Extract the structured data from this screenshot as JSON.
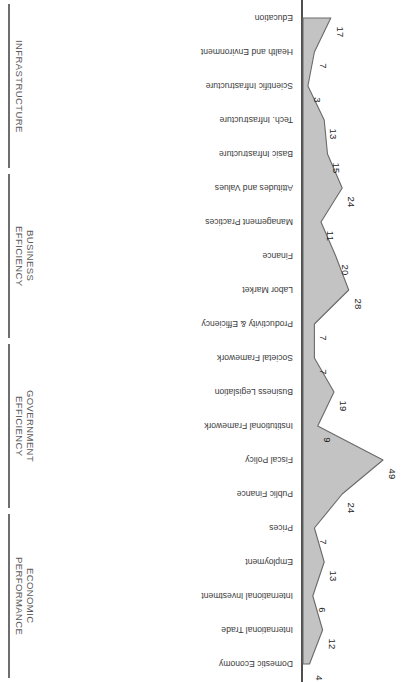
{
  "chart": {
    "type": "area",
    "orientation": "horizontal-rotated-180",
    "colors": {
      "area_fill": "#c3c3c3",
      "area_stroke": "#6a6a6a",
      "axis": "#4f4f4f",
      "group_axis": "#6e6e6e",
      "label_text": "#3b3b3b",
      "group_text": "#5a5a5a",
      "value_text": "#262626"
    }
  },
  "chart_data": {
    "type": "area",
    "title": "",
    "xlabel": "",
    "ylabel": "",
    "xlim": [
      0,
      50
    ],
    "grid": false,
    "legend": "none",
    "value_axis_note": "rank (lower is better); plotted leftward from baseline",
    "categories": [
      "Domestic Economy",
      "International Trade",
      "International Investment",
      "Employment",
      "Prices",
      "Public Finance",
      "Fiscal Policy",
      "Institutional Framework",
      "Business Legislation",
      "Societal Framework",
      "Productivity & Efficiency",
      "Labor Market",
      "Finance",
      "Management Practices",
      "Attitudes and Values",
      "Basic Infrastructure",
      "Tech. Infrastructure",
      "Scientific Infrastructure",
      "Health and Environment",
      "Education"
    ],
    "values": [
      4,
      12,
      6,
      13,
      7,
      24,
      49,
      9,
      19,
      7,
      7,
      28,
      20,
      11,
      24,
      15,
      13,
      3,
      7,
      17
    ],
    "groups": [
      {
        "label": "ECONOMIC\nPERFORMANCE",
        "start": 0,
        "end": 4
      },
      {
        "label": "GOVERNMENT\nEFFICIENCY",
        "start": 5,
        "end": 9
      },
      {
        "label": "BUSINESS\nEFFICIENCY",
        "start": 10,
        "end": 14
      },
      {
        "label": "INFRASTRUCTURE",
        "start": 15,
        "end": 19
      }
    ]
  }
}
